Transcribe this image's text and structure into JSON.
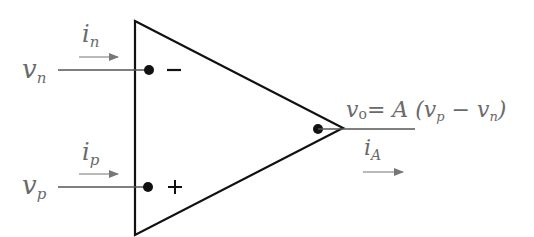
{
  "diagram": {
    "inputs": {
      "inverting": {
        "voltage_var": "v",
        "voltage_sub": "n",
        "current_var": "i",
        "current_sub": "n",
        "sign": "−"
      },
      "noninverting": {
        "voltage_var": "v",
        "voltage_sub": "p",
        "current_var": "i",
        "current_sub": "p",
        "sign": "+"
      }
    },
    "output": {
      "equation_lhs_var": "v",
      "equation_lhs_sub": "o",
      "equation_eq": "= A",
      "equation_open": " (v",
      "equation_sub1": "p",
      "equation_minus": " − v",
      "equation_sub2": "n",
      "equation_close": ")",
      "current_var": "i",
      "current_sub": "A"
    },
    "colors": {
      "stroke": "#111111",
      "text": "#6a6a6a",
      "arrow": "#777777"
    }
  }
}
